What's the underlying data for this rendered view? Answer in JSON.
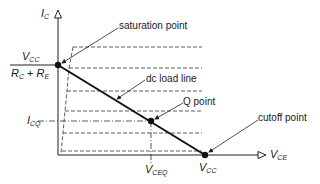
{
  "diagram": {
    "axes": {
      "y": {
        "symbol": "I",
        "subscript": "C"
      },
      "x": {
        "symbol": "V",
        "subscript": "CE"
      }
    },
    "y_intercept_label": {
      "numerator": {
        "symbol": "V",
        "subscript": "CC"
      },
      "denominator": {
        "r1": "R",
        "r1_sub": "C",
        "plus": "+",
        "r2": "R",
        "r2_sub": "E"
      }
    },
    "icq_label": {
      "symbol": "I",
      "subscript": "CQ"
    },
    "vceq_label": {
      "symbol": "V",
      "subscript": "CEQ"
    },
    "vcc_label": {
      "symbol": "V",
      "subscript": "CC"
    },
    "annotations": {
      "saturation": "saturation point",
      "load_line": "dc load line",
      "q_point": "Q point",
      "cutoff": "cutoff point"
    },
    "colors": {
      "ink": "#1a1a1a",
      "background": "#ffffff"
    }
  }
}
